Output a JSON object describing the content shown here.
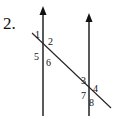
{
  "problem_number": "2.",
  "colors": {
    "line": "#222222",
    "background": "#ffffff"
  },
  "lines": {
    "left_parallel": {
      "x": 43,
      "y_top": 7,
      "y_bottom": 116,
      "arrow": "up"
    },
    "right_parallel": {
      "x": 89,
      "y_top": 14,
      "y_bottom": 116,
      "arrow": "up"
    },
    "transversal": {
      "x1": 32,
      "y1": 33,
      "x2": 111,
      "y2": 108
    }
  },
  "angles": [
    {
      "id": "1",
      "label": "1",
      "x": 35,
      "y": 38
    },
    {
      "id": "2",
      "label": "2",
      "x": 48,
      "y": 45
    },
    {
      "id": "5",
      "label": "5",
      "x": 34,
      "y": 60
    },
    {
      "id": "6",
      "label": "6",
      "x": 46,
      "y": 66
    },
    {
      "id": "3",
      "label": "3",
      "x": 81,
      "y": 84
    },
    {
      "id": "4",
      "label": "4",
      "x": 93,
      "y": 92
    },
    {
      "id": "7",
      "label": "7",
      "x": 81,
      "y": 99
    },
    {
      "id": "8",
      "label": "8",
      "x": 89,
      "y": 106
    }
  ]
}
